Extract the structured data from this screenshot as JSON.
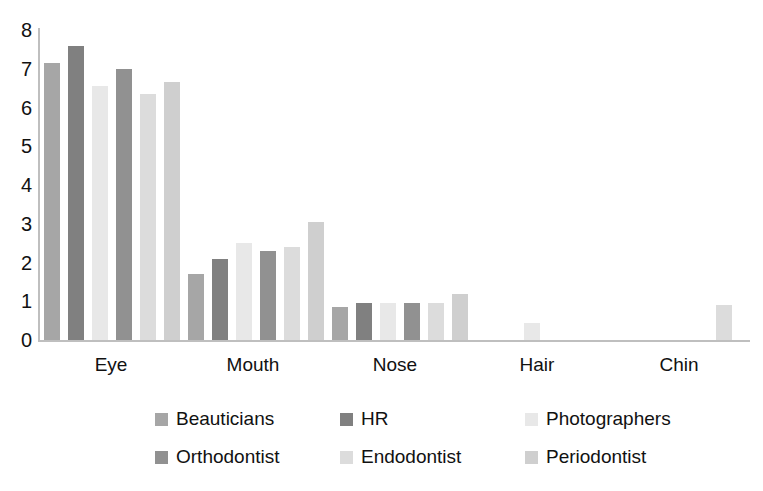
{
  "chart_data": {
    "type": "bar",
    "title": "",
    "subtitle": "",
    "xlabel": "",
    "ylabel": "",
    "ylim": [
      0,
      8
    ],
    "ytick_labels": [
      "8",
      "7",
      "6",
      "5",
      "4",
      "3",
      "2",
      "1",
      "0"
    ],
    "ytick_values": [
      8,
      7,
      6,
      5,
      4,
      3,
      2,
      1,
      0
    ],
    "grid": false,
    "legend_position": "bottom",
    "categories": [
      "Eye",
      "Mouth",
      "Nose",
      "Hair",
      "Chin"
    ],
    "series": [
      {
        "name": "Beauticians",
        "color": "#a6a6a6",
        "values": [
          7.15,
          1.7,
          0.85,
          0,
          0
        ]
      },
      {
        "name": "HR",
        "color": "#808080",
        "values": [
          7.6,
          2.1,
          0.95,
          0,
          0
        ]
      },
      {
        "name": "Photographers",
        "color": "#e8e8e8",
        "values": [
          6.55,
          2.5,
          0.95,
          0.45,
          0
        ]
      },
      {
        "name": "Orthodontist",
        "color": "#919191",
        "values": [
          7.0,
          2.3,
          0.95,
          0,
          0
        ]
      },
      {
        "name": "Endodontist",
        "color": "#dcdcdc",
        "values": [
          6.35,
          2.4,
          0.95,
          0,
          0.9
        ]
      },
      {
        "name": "Periodontist",
        "color": "#cfcfcf",
        "values": [
          6.65,
          3.05,
          1.2,
          0,
          0
        ]
      }
    ]
  },
  "axis": {
    "axis_line_color": "#bfbfbf"
  }
}
